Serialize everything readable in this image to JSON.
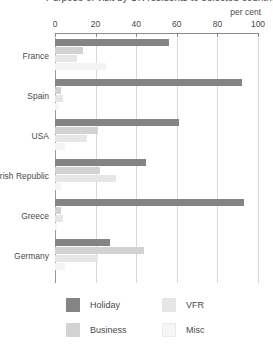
{
  "title": "Purpose of visit by UK residents to selected countries",
  "percent_caption": "per cent",
  "axis": {
    "ticks": [
      "0",
      "20",
      "40",
      "60",
      "80",
      "100"
    ],
    "min": 0,
    "max": 100
  },
  "legend": {
    "items": [
      {
        "label": "Holiday",
        "color": "#848484",
        "icon": "legend-swatch-icon"
      },
      {
        "label": "Business",
        "color": "#d2d2d2",
        "icon": "legend-swatch-icon"
      },
      {
        "label": "VFR",
        "color": "#e6e6e6",
        "icon": "legend-swatch-icon"
      },
      {
        "label": "Misc",
        "color": "#f6f6f6",
        "icon": "legend-swatch-icon"
      }
    ]
  },
  "chart_data": {
    "type": "bar",
    "orientation": "horizontal",
    "title": "Purpose of visit by UK residents to selected countries",
    "xlabel": "per cent",
    "ylabel": "",
    "xlim": [
      0,
      100
    ],
    "grid": true,
    "legend_position": "bottom",
    "categories": [
      "France",
      "Spain",
      "USA",
      "Irish Republic",
      "Greece",
      "Germany"
    ],
    "series": [
      {
        "name": "Holiday",
        "color": "#848484",
        "values": [
          56,
          92,
          61,
          45,
          93,
          27
        ]
      },
      {
        "name": "Business",
        "color": "#d2d2d2",
        "values": [
          14,
          3,
          21,
          22,
          3,
          44
        ]
      },
      {
        "name": "VFR",
        "color": "#e6e6e6",
        "values": [
          11,
          4,
          16,
          30,
          4,
          21
        ]
      },
      {
        "name": "Misc",
        "color": "#f4f4f4",
        "values": [
          25,
          2,
          5,
          3,
          1,
          5
        ]
      }
    ]
  }
}
